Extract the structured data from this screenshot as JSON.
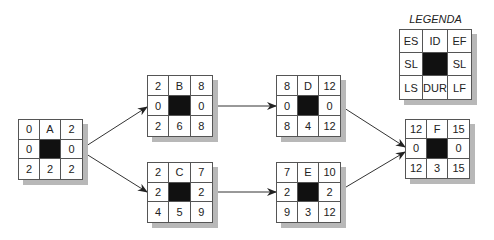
{
  "legend": {
    "title": "LEGENDA",
    "cells": [
      "ES",
      "ID",
      "EF",
      "SL",
      "",
      "SL",
      "LS",
      "DUR",
      "LF"
    ]
  },
  "nodes": [
    {
      "id": "A",
      "cells": [
        "0",
        "A",
        "2",
        "0",
        "",
        "0",
        "2",
        "2",
        "2"
      ]
    },
    {
      "id": "B",
      "cells": [
        "2",
        "B",
        "8",
        "0",
        "",
        "0",
        "2",
        "6",
        "8"
      ]
    },
    {
      "id": "C",
      "cells": [
        "2",
        "C",
        "7",
        "2",
        "",
        "2",
        "4",
        "5",
        "9"
      ]
    },
    {
      "id": "D",
      "cells": [
        "8",
        "D",
        "12",
        "0",
        "",
        "0",
        "8",
        "4",
        "12"
      ]
    },
    {
      "id": "E",
      "cells": [
        "7",
        "E",
        "10",
        "2",
        "",
        "2",
        "9",
        "3",
        "12"
      ]
    },
    {
      "id": "F",
      "cells": [
        "12",
        "F",
        "15",
        "0",
        "",
        "0",
        "12",
        "3",
        "15"
      ]
    }
  ],
  "edges": [
    {
      "from": "A",
      "to": "B"
    },
    {
      "from": "A",
      "to": "C"
    },
    {
      "from": "B",
      "to": "D"
    },
    {
      "from": "C",
      "to": "E"
    },
    {
      "from": "D",
      "to": "F"
    },
    {
      "from": "E",
      "to": "F"
    }
  ]
}
